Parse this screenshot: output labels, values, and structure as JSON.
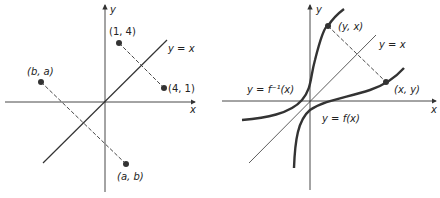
{
  "left_diagram": {
    "axis_x_label": "x",
    "axis_y_label": "y",
    "line_label": "y = x",
    "points": [
      {
        "label": "(1, 4)"
      },
      {
        "label": "(4, 1)"
      },
      {
        "label": "(b, a)"
      },
      {
        "label": "(a, b)"
      }
    ]
  },
  "right_diagram": {
    "axis_x_label": "x",
    "axis_y_label": "y",
    "line_label": "y = x",
    "inverse_label": "y = f⁻¹(x)",
    "function_label": "y = f(x)",
    "points": [
      {
        "label": "(y, x)"
      },
      {
        "label": "(x, y)"
      }
    ]
  },
  "colors": {
    "ink": "#2a2a2a",
    "curve": "#333333"
  }
}
